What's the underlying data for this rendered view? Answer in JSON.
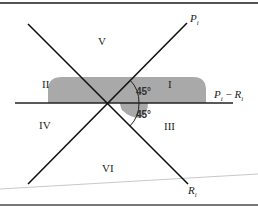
{
  "diagram": {
    "regions": {
      "I": "I",
      "II": "II",
      "III": "III",
      "IV": "IV",
      "V": "V",
      "VI": "VI"
    },
    "angles": {
      "upper": "45°",
      "lower": "45°"
    },
    "axes": {
      "p_label": "P",
      "p_sub": "i",
      "r_label": "R",
      "r_sub": "i",
      "diff_label_p": "P",
      "diff_label_p_sub": "i",
      "diff_label_minus": " − ",
      "diff_label_r": "R",
      "diff_label_r_sub": "i"
    },
    "colors": {
      "lines": "#111111",
      "shading": "#a9a9a9",
      "border": "#666666",
      "baseline": "#c8c8c8"
    }
  }
}
